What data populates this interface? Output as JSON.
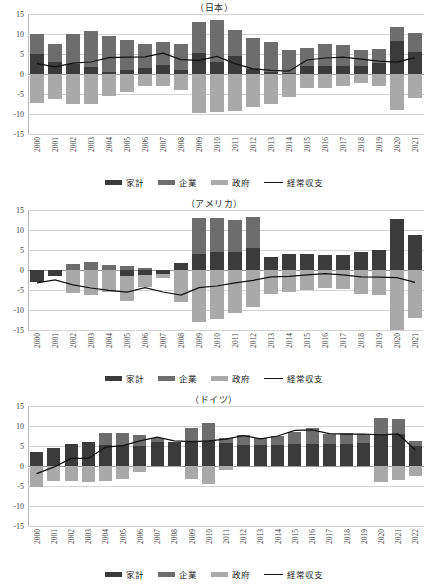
{
  "page": {
    "background": "#ffffff",
    "colors": {
      "household": "#3b3b3b",
      "corporate": "#6d6d6d",
      "government": "#a9a9a9",
      "line": "#111111",
      "grid": "#d4d4d4"
    }
  },
  "legend": {
    "items": [
      {
        "key": "household",
        "label": "家計",
        "type": "bar"
      },
      {
        "key": "corporate",
        "label": "企業",
        "type": "bar"
      },
      {
        "key": "government",
        "label": "政府",
        "type": "bar"
      },
      {
        "key": "balance",
        "label": "経常収支",
        "type": "line"
      }
    ]
  },
  "yaxis": {
    "ticks": [
      "15",
      "10",
      "5",
      "0",
      "-5",
      "-10",
      "-15"
    ],
    "min": -15,
    "max": 15
  },
  "chart_data": [
    {
      "type": "bar",
      "id": "japan",
      "title": "（日本）",
      "xlabel": "",
      "ylabel": "",
      "ylim": [
        -15,
        15
      ],
      "grid": true,
      "legend_position": "bottom",
      "stacked": true,
      "categories": [
        "2000",
        "2001",
        "2002",
        "2003",
        "2004",
        "2005",
        "2006",
        "2007",
        "2008",
        "2009",
        "2010",
        "2011",
        "2012",
        "2013",
        "2014",
        "2015",
        "2016",
        "2017",
        "2018",
        "2019",
        "2020",
        "2021"
      ],
      "series": [
        {
          "name": "家計",
          "key": "household",
          "values": [
            4.9,
            3.1,
            2.6,
            1.8,
            0.6,
            1.0,
            1.5,
            2.3,
            1.0,
            5.3,
            3.1,
            4.5,
            1.2,
            0.4,
            0.2,
            2.0,
            2.0,
            1.9,
            2.0,
            2.7,
            8.2,
            5.4
          ]
        },
        {
          "name": "企業",
          "key": "corporate",
          "values": [
            5.1,
            4.5,
            7.4,
            9.0,
            8.9,
            7.6,
            5.9,
            5.8,
            6.4,
            7.6,
            10.4,
            6.6,
            7.8,
            7.7,
            5.9,
            4.5,
            5.4,
            5.3,
            3.9,
            3.6,
            3.6,
            4.8
          ]
        },
        {
          "name": "政府",
          "key": "government",
          "values": [
            -7.3,
            -6.2,
            -7.4,
            -7.5,
            -5.4,
            -4.4,
            -3.0,
            -3.1,
            -4.1,
            -9.8,
            -9.4,
            -9.2,
            -8.2,
            -7.5,
            -5.7,
            -3.5,
            -3.4,
            -3.0,
            -2.3,
            -3.0,
            -9.0,
            -6.0
          ]
        }
      ],
      "line_series": {
        "name": "経常収支",
        "values": [
          2.6,
          1.8,
          2.7,
          3.0,
          4.1,
          4.2,
          4.3,
          5.2,
          3.6,
          3.4,
          4.4,
          2.6,
          1.3,
          0.9,
          0.7,
          3.5,
          4.0,
          4.2,
          3.7,
          3.2,
          3.0,
          4.1
        ]
      }
    },
    {
      "type": "bar",
      "id": "america",
      "title": "（アメリカ）",
      "xlabel": "",
      "ylabel": "",
      "ylim": [
        -15,
        15
      ],
      "grid": true,
      "legend_position": "bottom",
      "stacked": true,
      "categories": [
        "2000",
        "2001",
        "2002",
        "2003",
        "2004",
        "2005",
        "2006",
        "2007",
        "2008",
        "2009",
        "2010",
        "2011",
        "2012",
        "2013",
        "2014",
        "2015",
        "2016",
        "2017",
        "2018",
        "2019",
        "2020",
        "2021"
      ],
      "series": [
        {
          "name": "家計",
          "key": "household",
          "values": [
            -3.0,
            -1.4,
            0.0,
            0.0,
            0.0,
            -1.5,
            -1.3,
            -0.9,
            1.8,
            4.0,
            4.4,
            4.6,
            5.6,
            3.3,
            3.9,
            3.9,
            3.7,
            3.8,
            4.4,
            5.1,
            12.7,
            8.8
          ]
        },
        {
          "name": "企業",
          "key": "corporate",
          "values": [
            0.0,
            0.0,
            1.6,
            1.9,
            1.3,
            1.1,
            0.4,
            0.0,
            0.0,
            8.9,
            8.6,
            7.9,
            7.6,
            0.0,
            0.0,
            0.0,
            0.0,
            0.0,
            0.0,
            0.0,
            0.0,
            0.0
          ]
        },
        {
          "name": "政府",
          "key": "government",
          "values": [
            0.0,
            0.0,
            -5.8,
            -6.2,
            -5.6,
            -6.2,
            -3.0,
            -1.2,
            -8.0,
            -13.0,
            -12.3,
            -10.8,
            -9.2,
            -6.0,
            -5.5,
            -5.0,
            -4.6,
            -4.7,
            -6.0,
            -6.2,
            -15.0,
            -11.9
          ]
        }
      ],
      "line_series": {
        "name": "経常収支",
        "values": [
          -3.2,
          -2.5,
          -3.7,
          -4.5,
          -5.1,
          -5.5,
          -4.4,
          -5.5,
          -6.3,
          -4.4,
          -4.0,
          -3.2,
          -2.6,
          -1.7,
          -1.6,
          -1.2,
          -0.9,
          -1.2,
          -1.7,
          -1.8,
          -1.9,
          -3.1
        ]
      }
    },
    {
      "type": "bar",
      "id": "germany",
      "title": "（ドイツ）",
      "xlabel": "",
      "ylabel": "",
      "ylim": [
        -15,
        15
      ],
      "grid": true,
      "legend_position": "bottom",
      "stacked": true,
      "categories": [
        "2000",
        "2001",
        "2002",
        "2003",
        "2004",
        "2005",
        "2006",
        "2007",
        "2008",
        "2009",
        "2010",
        "2011",
        "2012",
        "2013",
        "2014",
        "2015",
        "2016",
        "2017",
        "2018",
        "2019",
        "2020",
        "2021",
        "2022"
      ],
      "series": [
        {
          "name": "家計",
          "key": "household",
          "values": [
            3.5,
            4.4,
            5.5,
            5.9,
            5.2,
            5.3,
            5.0,
            6.0,
            6.0,
            6.1,
            6.3,
            5.7,
            5.3,
            5.2,
            5.3,
            5.4,
            5.5,
            5.4,
            5.6,
            5.7,
            7.7,
            7.9,
            5.0
          ]
        },
        {
          "name": "企業",
          "key": "corporate",
          "values": [
            0.0,
            0.0,
            0.0,
            0.0,
            3.0,
            3.0,
            2.7,
            1.0,
            0.0,
            3.4,
            4.5,
            1.3,
            2.4,
            1.9,
            2.2,
            3.0,
            3.9,
            2.6,
            2.6,
            2.4,
            4.2,
            3.8,
            1.2
          ]
        },
        {
          "name": "政府",
          "key": "government",
          "values": [
            -5.3,
            -3.8,
            -3.8,
            -4.1,
            -3.7,
            -3.3,
            -1.6,
            0.0,
            -0.2,
            -3.2,
            -4.4,
            -1.0,
            0.0,
            0.0,
            0.0,
            0.0,
            0.0,
            0.0,
            0.0,
            0.0,
            -3.9,
            -3.4,
            -2.6
          ]
        }
      ],
      "line_series": {
        "name": "経常収支",
        "values": [
          -1.9,
          -0.3,
          1.9,
          1.9,
          4.7,
          5.1,
          6.3,
          7.2,
          6.3,
          6.1,
          6.3,
          6.7,
          7.6,
          6.8,
          7.5,
          8.9,
          9.0,
          8.1,
          8.0,
          8.0,
          7.8,
          8.0,
          4.0
        ]
      }
    }
  ]
}
